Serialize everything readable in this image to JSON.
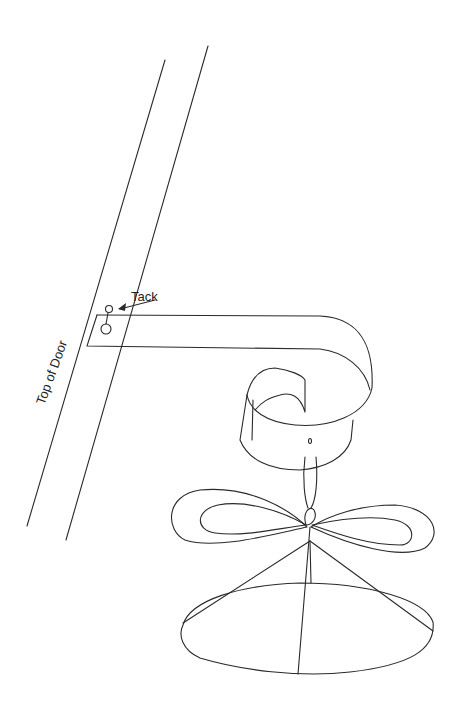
{
  "figure": {
    "labels": {
      "tack": "Tack",
      "door": "Top of Door"
    },
    "colors": {
      "stroke": "#2a2a2a",
      "background": "#ffffff"
    }
  }
}
